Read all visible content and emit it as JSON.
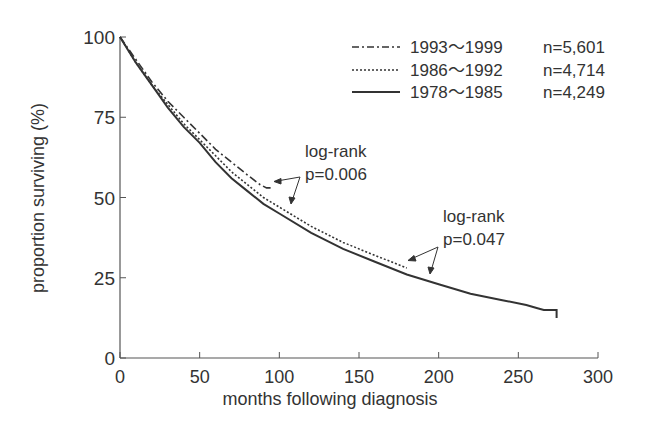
{
  "chart_data": {
    "type": "line",
    "title": "",
    "xlabel": "months following diagnosis",
    "ylabel": "proportion surviving (%)",
    "xlim": [
      0,
      300
    ],
    "ylim": [
      0,
      100
    ],
    "x_ticks": [
      "0",
      "50",
      "100",
      "150",
      "200",
      "250",
      "300"
    ],
    "y_ticks": [
      "0",
      "25",
      "50",
      "75",
      "100"
    ],
    "grid": false,
    "legend_position": "upper right",
    "series": [
      {
        "name": "1993～1999",
        "n_label": "n=5,601",
        "style": "dash-dot",
        "x": [
          0,
          10,
          20,
          30,
          40,
          50,
          60,
          70,
          80,
          88,
          92,
          96
        ],
        "y": [
          100,
          93,
          86,
          80,
          75,
          70,
          65,
          61,
          57,
          54,
          53,
          53
        ]
      },
      {
        "name": "1986～1992",
        "n_label": "n=4,714",
        "style": "dotted",
        "x": [
          0,
          10,
          20,
          30,
          40,
          50,
          60,
          70,
          80,
          90,
          100,
          120,
          140,
          160,
          180
        ],
        "y": [
          100,
          92,
          85,
          79,
          73,
          68,
          63,
          58,
          54,
          50,
          47,
          41,
          36,
          32,
          28
        ]
      },
      {
        "name": "1978～1985",
        "n_label": "n=4,249",
        "style": "solid",
        "x": [
          0,
          10,
          20,
          30,
          40,
          50,
          60,
          70,
          80,
          90,
          100,
          120,
          140,
          160,
          180,
          200,
          220,
          240,
          255,
          262,
          266,
          274,
          274
        ],
        "y": [
          100,
          92,
          85,
          78,
          72,
          67,
          61,
          56,
          52,
          48,
          45,
          39,
          34,
          30,
          26,
          23,
          20,
          18,
          16.5,
          15.5,
          15,
          15,
          12.5
        ]
      }
    ],
    "annotations": [
      {
        "text_line1": "log-rank",
        "text_line2": "p=0.006"
      },
      {
        "text_line1": "log-rank",
        "text_line2": "p=0.047"
      }
    ]
  }
}
